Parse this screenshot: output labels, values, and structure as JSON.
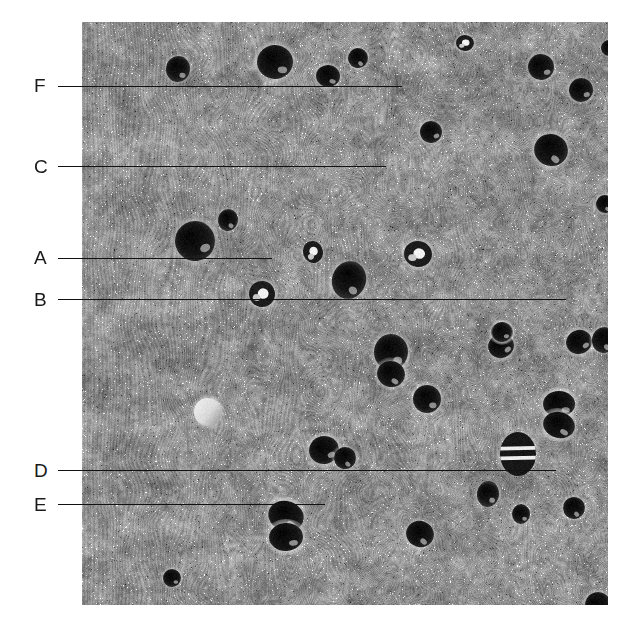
{
  "figure": {
    "type": "labeled-micrograph",
    "caption": "",
    "background_color": "#ffffff",
    "plate": {
      "x": 82,
      "y": 22,
      "width": 526,
      "height": 583,
      "description": "Scanning electron micrograph of a transverse section showing vertically striated matrix with scattered dark circular pores",
      "base_color": "#8d8d8d",
      "light_color": "#c8c8c8",
      "dark_color": "#242424",
      "striation_orientation": "vertical",
      "pores": [
        {
          "cx": 96,
          "cy": 47,
          "rx": 12,
          "ry": 13,
          "tone": "dark"
        },
        {
          "cx": 193,
          "cy": 40,
          "rx": 18,
          "ry": 17,
          "tone": "dark"
        },
        {
          "cx": 246,
          "cy": 54,
          "rx": 12,
          "ry": 11,
          "tone": "dark"
        },
        {
          "cx": 276,
          "cy": 36,
          "rx": 10,
          "ry": 10,
          "tone": "dark"
        },
        {
          "cx": 383,
          "cy": 21,
          "rx": 9,
          "ry": 8,
          "tone": "mixed"
        },
        {
          "cx": 459,
          "cy": 45,
          "rx": 13,
          "ry": 13,
          "tone": "dark"
        },
        {
          "cx": 499,
          "cy": 68,
          "rx": 12,
          "ry": 12,
          "tone": "dark"
        },
        {
          "cx": 527,
          "cy": 26,
          "rx": 8,
          "ry": 8,
          "tone": "dark"
        },
        {
          "cx": 606,
          "cy": 75,
          "rx": 15,
          "ry": 16,
          "tone": "dark"
        },
        {
          "cx": 349,
          "cy": 110,
          "rx": 11,
          "ry": 11,
          "tone": "dark"
        },
        {
          "cx": 469,
          "cy": 128,
          "rx": 17,
          "ry": 16,
          "tone": "dark"
        },
        {
          "cx": 580,
          "cy": 148,
          "rx": 11,
          "ry": 11,
          "tone": "dark"
        },
        {
          "cx": 597,
          "cy": 156,
          "rx": 10,
          "ry": 11,
          "tone": "dark"
        },
        {
          "cx": 523,
          "cy": 182,
          "rx": 9,
          "ry": 9,
          "tone": "dark"
        },
        {
          "cx": 554,
          "cy": 192,
          "rx": 8,
          "ry": 8,
          "tone": "dark"
        },
        {
          "cx": 113,
          "cy": 219,
          "rx": 20,
          "ry": 20,
          "tone": "dark"
        },
        {
          "cx": 231,
          "cy": 230,
          "rx": 10,
          "ry": 11,
          "tone": "mixed"
        },
        {
          "cx": 336,
          "cy": 232,
          "rx": 14,
          "ry": 13,
          "tone": "mixed"
        },
        {
          "cx": 267,
          "cy": 258,
          "rx": 17,
          "ry": 19,
          "tone": "dark"
        },
        {
          "cx": 180,
          "cy": 272,
          "rx": 13,
          "ry": 13,
          "tone": "mixed"
        },
        {
          "cx": 566,
          "cy": 290,
          "rx": 17,
          "ry": 24,
          "tone": "striped"
        },
        {
          "cx": 602,
          "cy": 298,
          "rx": 10,
          "ry": 17,
          "tone": "dark"
        },
        {
          "cx": 309,
          "cy": 330,
          "rx": 17,
          "ry": 18,
          "tone": "dark"
        },
        {
          "cx": 419,
          "cy": 324,
          "rx": 13,
          "ry": 12,
          "tone": "dark"
        },
        {
          "cx": 309,
          "cy": 352,
          "rx": 14,
          "ry": 13,
          "tone": "dark"
        },
        {
          "cx": 497,
          "cy": 320,
          "rx": 13,
          "ry": 12,
          "tone": "dark"
        },
        {
          "cx": 522,
          "cy": 318,
          "rx": 12,
          "ry": 13,
          "tone": "dark"
        },
        {
          "cx": 420,
          "cy": 310,
          "rx": 11,
          "ry": 10,
          "tone": "dark"
        },
        {
          "cx": 345,
          "cy": 377,
          "rx": 14,
          "ry": 14,
          "tone": "dark"
        },
        {
          "cx": 126,
          "cy": 390,
          "rx": 14,
          "ry": 14,
          "tone": "light"
        },
        {
          "cx": 477,
          "cy": 382,
          "rx": 16,
          "ry": 13,
          "tone": "dark"
        },
        {
          "cx": 477,
          "cy": 403,
          "rx": 16,
          "ry": 13,
          "tone": "dark"
        },
        {
          "cx": 242,
          "cy": 428,
          "rx": 15,
          "ry": 14,
          "tone": "dark"
        },
        {
          "cx": 263,
          "cy": 436,
          "rx": 11,
          "ry": 11,
          "tone": "dark"
        },
        {
          "cx": 436,
          "cy": 432,
          "rx": 18,
          "ry": 22,
          "tone": "striped"
        },
        {
          "cx": 592,
          "cy": 370,
          "rx": 10,
          "ry": 12,
          "tone": "dark"
        },
        {
          "cx": 420,
          "cy": 310,
          "rx": 10,
          "ry": 10,
          "tone": "dark"
        },
        {
          "cx": 204,
          "cy": 494,
          "rx": 18,
          "ry": 15,
          "tone": "dark"
        },
        {
          "cx": 204,
          "cy": 515,
          "rx": 17,
          "ry": 14,
          "tone": "dark"
        },
        {
          "cx": 338,
          "cy": 512,
          "rx": 14,
          "ry": 13,
          "tone": "dark"
        },
        {
          "cx": 406,
          "cy": 472,
          "rx": 11,
          "ry": 13,
          "tone": "dark"
        },
        {
          "cx": 572,
          "cy": 473,
          "rx": 19,
          "ry": 19,
          "tone": "dark"
        },
        {
          "cx": 492,
          "cy": 486,
          "rx": 11,
          "ry": 11,
          "tone": "dark"
        },
        {
          "cx": 439,
          "cy": 492,
          "rx": 9,
          "ry": 10,
          "tone": "dark"
        },
        {
          "cx": 516,
          "cy": 583,
          "rx": 13,
          "ry": 13,
          "tone": "dark"
        },
        {
          "cx": 611,
          "cy": 552,
          "rx": 9,
          "ry": 9,
          "tone": "dark"
        },
        {
          "cx": 90,
          "cy": 556,
          "rx": 9,
          "ry": 9,
          "tone": "dark"
        },
        {
          "cx": 146,
          "cy": 198,
          "rx": 10,
          "ry": 11,
          "tone": "dark"
        }
      ]
    },
    "labels": [
      {
        "id": "F",
        "text": "F",
        "label_x": 34,
        "label_y": 76,
        "line_y": 86,
        "line_x1": 58,
        "line_x2": 402
      },
      {
        "id": "C",
        "text": "C",
        "label_x": 34,
        "label_y": 157,
        "line_y": 166,
        "line_x1": 58,
        "line_x2": 386
      },
      {
        "id": "A",
        "text": "A",
        "label_x": 34,
        "label_y": 248,
        "line_y": 258,
        "line_x1": 58,
        "line_x2": 272
      },
      {
        "id": "B",
        "text": "B",
        "label_x": 34,
        "label_y": 290,
        "line_y": 299,
        "line_x1": 58,
        "line_x2": 566
      },
      {
        "id": "D",
        "text": "D",
        "label_x": 34,
        "label_y": 461,
        "line_y": 470,
        "line_x1": 58,
        "line_x2": 556
      },
      {
        "id": "E",
        "text": "E",
        "label_x": 34,
        "label_y": 495,
        "line_y": 504,
        "line_x1": 58,
        "line_x2": 325
      }
    ]
  }
}
